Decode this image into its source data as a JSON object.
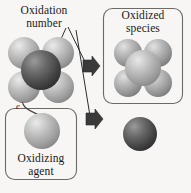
{
  "figure": {
    "name": "oxidation-reduction-schematic",
    "background_color": "#f7f6f4"
  },
  "labels": {
    "oxidation_number": "Oxidation\nnumber",
    "oxidized_species": "Oxidized\nspecies",
    "oxidizing_agent": "Oxidizing\nagent",
    "electron": "e"
  },
  "electron_superscript": "−",
  "boxes": [
    {
      "id": "oxidized-species-box",
      "label": "Oxidized species",
      "x": 103,
      "y": 8,
      "width": 80,
      "height": 96,
      "radius": 9,
      "stroke": "#6b6a67"
    },
    {
      "id": "oxidizing-agent-box",
      "label": "Oxidizing agent",
      "x": 5,
      "y": 108,
      "width": 72,
      "height": 72,
      "radius": 9,
      "stroke": "#6b6a67"
    }
  ],
  "molecules": [
    {
      "id": "reduced-species-molecule",
      "name": "reduced-species-molecule",
      "center": {
        "x": 41,
        "y": 70
      },
      "center_sphere": {
        "r": 20,
        "color": "#4a4a4a",
        "highlight": "#8a8a8a"
      },
      "ligand_r": 16,
      "ligand_color": "#9e9e9e",
      "ligand_highlight": "#d8d8d8",
      "ligand_offsets": [
        {
          "dx": -17,
          "dy": -17
        },
        {
          "dx": 17,
          "dy": -17
        },
        {
          "dx": -17,
          "dy": 17
        },
        {
          "dx": 17,
          "dy": 17
        }
      ]
    },
    {
      "id": "oxidized-species-molecule",
      "name": "oxidized-species-molecule",
      "center": {
        "x": 143,
        "y": 68
      },
      "center_sphere": {
        "r": 18,
        "color": "#a6a6a6",
        "highlight": "#dcdcdc"
      },
      "ligand_r": 14,
      "ligand_color": "#9a9a9a",
      "ligand_highlight": "#d4d4d4",
      "ligand_offsets": [
        {
          "dx": -15,
          "dy": -15
        },
        {
          "dx": 15,
          "dy": -15
        },
        {
          "dx": -15,
          "dy": 15
        },
        {
          "dx": 15,
          "dy": 15
        }
      ]
    }
  ],
  "spheres": [
    {
      "id": "oxidizing-agent-sphere",
      "name": "oxidizing-agent-sphere",
      "cx": 42,
      "cy": 131,
      "r": 18,
      "color": "#a2a2a2",
      "highlight": "#d9d9d9"
    },
    {
      "id": "reduced-agent-sphere",
      "name": "reduced-agent-sphere",
      "cx": 140,
      "cy": 134,
      "r": 17,
      "color": "#4d4d4d",
      "highlight": "#8e8e8e"
    }
  ],
  "arrows": [
    {
      "id": "upper-reaction-arrow",
      "name": "reaction-arrow-upper",
      "x": 83,
      "y": 65,
      "direction": "right",
      "color": "#3a3a3a"
    },
    {
      "id": "lower-reaction-arrow",
      "name": "reaction-arrow-lower",
      "x": 86,
      "y": 118,
      "direction": "right",
      "color": "#3a3a3a"
    }
  ],
  "leader_lines": [
    {
      "id": "leader-to-center-atom",
      "from": "oxidation-number-label",
      "to": "reduced-species-center"
    },
    {
      "id": "leader-to-upper-arrow",
      "from": "oxidation-number-label",
      "to": "reaction-arrow-upper"
    },
    {
      "id": "leader-to-lower-arrow",
      "from": "oxidation-number-label",
      "to": "reaction-arrow-lower"
    }
  ],
  "electron_path": {
    "id": "electron-transfer-path",
    "name": "electron-transfer-arrow",
    "from": "reduced-species-center",
    "to": "oxidizing-agent-sphere",
    "color": "#4a4743"
  },
  "colors": {
    "ink": "#1c1a18",
    "box_stroke": "#6b6a67",
    "arrow_fill": "#3a3a3a",
    "leader_line": "#2e2c2a",
    "dark_sphere": "#4a4a4a",
    "mid_sphere": "#9e9e9e",
    "light_sphere": "#a2a2a2"
  }
}
